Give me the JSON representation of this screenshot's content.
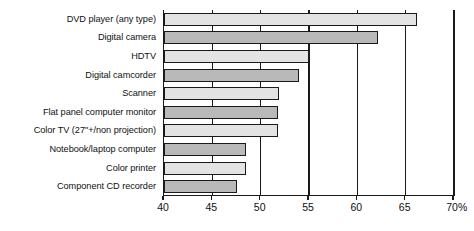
{
  "chart_data": {
    "type": "bar",
    "orientation": "horizontal",
    "title": "",
    "xlabel": "",
    "ylabel": "",
    "xlim": [
      40,
      70
    ],
    "ylim": null,
    "grid": true,
    "legend": null,
    "axis_unit_suffix": "%",
    "tick_labels": [
      "40",
      "45",
      "50",
      "55",
      "60",
      "65",
      "70%"
    ],
    "tick_values": [
      40,
      45,
      50,
      55,
      60,
      65,
      70
    ],
    "categories": [
      "DVD player (any type)",
      "Digital camera",
      "HDTV",
      "Digital camcorder",
      "Scanner",
      "Flat panel computer monitor",
      "Color TV (27\"+/non projection)",
      "Notebook/laptop computer",
      "Color printer",
      "Component CD recorder"
    ],
    "values": [
      66.2,
      62.1,
      55.0,
      54.0,
      51.9,
      51.8,
      51.8,
      48.5,
      48.5,
      47.5
    ],
    "bar_shades": [
      "light",
      "dark",
      "light",
      "dark",
      "light",
      "dark",
      "light",
      "dark",
      "light",
      "dark"
    ],
    "colors": {
      "bar_light": "#e3e3e3",
      "bar_dark": "#b9b9b9",
      "bar_border": "#1a1a1a",
      "axis": "#1a1a1a",
      "text": "#101010",
      "background": "#ffffff"
    }
  }
}
